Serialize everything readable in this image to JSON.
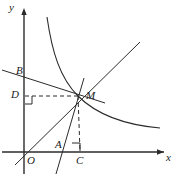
{
  "figure": {
    "kind": "geometry-diagram",
    "width": 176,
    "height": 180,
    "stroke_color": "#2b2b2b",
    "background_color": "#ffffff"
  },
  "axes": {
    "x_label": "x",
    "y_label": "y",
    "origin_label": "O",
    "x_axis_y": 152,
    "y_axis_x": 24
  },
  "points": [
    {
      "id": "O",
      "label": "O",
      "x": 24,
      "y": 152,
      "label_x": 27,
      "label_y": 155
    },
    {
      "id": "A",
      "label": "A",
      "x": 60,
      "y": 152,
      "label_x": 55,
      "label_y": 140
    },
    {
      "id": "C",
      "label": "C",
      "x": 80,
      "y": 152,
      "label_x": 76,
      "label_y": 155
    },
    {
      "id": "D",
      "label": "D",
      "x": 24,
      "y": 96,
      "label_x": 12,
      "label_y": 90
    },
    {
      "id": "B",
      "label": "B",
      "x": 24,
      "y": 73,
      "label_x": 16,
      "label_y": 66
    },
    {
      "id": "M",
      "label": "M",
      "x": 78,
      "y": 96,
      "label_x": 86,
      "label_y": 92
    }
  ],
  "curves": [
    {
      "id": "hyperbola",
      "name": "hyperbola-branch",
      "style": "solid"
    },
    {
      "id": "line-OM",
      "name": "line-through-origin",
      "style": "solid"
    },
    {
      "id": "line-BM",
      "name": "shallow-secant-line",
      "style": "solid"
    },
    {
      "id": "line-AM",
      "name": "steep-line",
      "style": "solid"
    },
    {
      "id": "seg-MD",
      "name": "perpendicular-to-y-axis",
      "style": "dashed"
    },
    {
      "id": "seg-MC",
      "name": "perpendicular-to-x-axis",
      "style": "dashed"
    }
  ],
  "right_angle_marks": [
    {
      "id": "angle-at-D",
      "at": "D"
    },
    {
      "id": "angle-at-C",
      "at": "C"
    }
  ]
}
